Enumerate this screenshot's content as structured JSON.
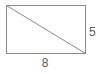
{
  "figure": {
    "type": "geometry-diagram",
    "shape": "rectangle-with-diagonal",
    "background_color": "#ffffff",
    "stroke_color": "#8a8a8a",
    "diagonal_color": "#8a8a8a",
    "label_color": "#5a5a5a",
    "rectangle": {
      "x": 6,
      "y": 5,
      "width": 79,
      "height": 48,
      "stroke_width": 1
    },
    "diagonal": {
      "x1": 6,
      "y1": 5,
      "x2": 85,
      "y2": 53,
      "stroke_width": 1,
      "description": "diagonal from top-left corner to bottom-right corner"
    },
    "labels": {
      "width": "8",
      "height": "5"
    }
  }
}
